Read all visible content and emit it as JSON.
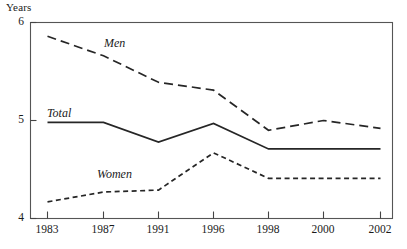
{
  "chart_data": {
    "type": "line",
    "title": "",
    "xlabel": "",
    "ylabel": "Years",
    "ylim": [
      4,
      6
    ],
    "xlim": [
      1983,
      2002
    ],
    "grid": false,
    "legend_position": "inline-labels",
    "categories": [
      "1983",
      "1987",
      "1991",
      "1996",
      "1998",
      "2000",
      "2002"
    ],
    "x": [
      1983,
      1987,
      1991,
      1996,
      1998,
      2000,
      2002
    ],
    "ytick_labels": [
      "6",
      "5",
      "4"
    ],
    "ytick_values": [
      6,
      5,
      4
    ],
    "series": [
      {
        "name": "Men",
        "style": "long-dashed",
        "color": "#262626",
        "values": [
          5.86,
          5.66,
          5.39,
          5.31,
          4.9,
          5.0,
          4.92
        ]
      },
      {
        "name": "Total",
        "style": "solid",
        "color": "#262626",
        "values": [
          4.98,
          4.98,
          4.78,
          4.97,
          4.71,
          4.71,
          4.71
        ]
      },
      {
        "name": "Women",
        "style": "short-dashed",
        "color": "#262626",
        "values": [
          4.17,
          4.27,
          4.29,
          4.67,
          4.41,
          4.41,
          4.41
        ]
      }
    ],
    "annotations": [
      {
        "text": "Men",
        "x": 1988.2,
        "y": 5.58
      },
      {
        "text": "Total",
        "x": 1984.3,
        "y": 5.07
      },
      {
        "text": "Women",
        "x": 1988.6,
        "y": 4.47
      }
    ]
  },
  "axis": {
    "y_title": "Years"
  }
}
